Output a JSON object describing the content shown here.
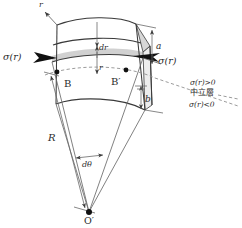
{
  "figure": {
    "kind": "engineering-diagram",
    "background_color": "#ffffff",
    "line_color": "#3a3a3a",
    "text_color": "#2b2b2b",
    "shade_color": "#c9c9c9",
    "arrow_color": "#111111"
  },
  "labels": {
    "axis_r": "r",
    "sigma_left": "σ(r)",
    "sigma_right": "σ(r)",
    "thickness_dr": "dr",
    "radius_r": "r",
    "dim_a": "a",
    "dim_b": "b",
    "point_b": "B",
    "point_b_prime": "B′",
    "radius_R": "R",
    "angle_dtheta": "dθ",
    "center_o_prime": "O′",
    "tension_note": "σ(r)>0",
    "neutral_layer_note": "中立層",
    "compression_note": "σ(r)<0"
  }
}
